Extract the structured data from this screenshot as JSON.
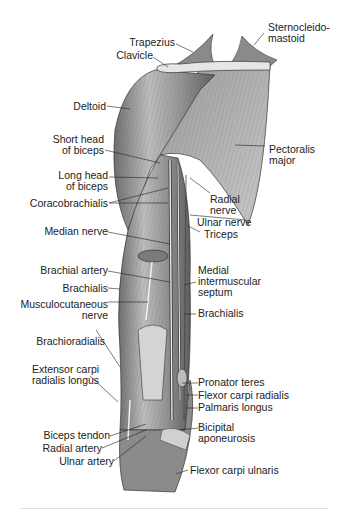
{
  "figure": {
    "colors": {
      "muscle": "#8c8c8c",
      "muscle_light": "#c9c9c9",
      "muscle_dark": "#4a4a4a",
      "bone": "#e4e4e4",
      "line": "#222222"
    },
    "labels_left": [
      {
        "id": "trapezius",
        "text": "Trapezius"
      },
      {
        "id": "clavicle",
        "text": "Clavicle"
      },
      {
        "id": "deltoid",
        "text": "Deltoid"
      },
      {
        "id": "short-head-biceps",
        "text": "Short head\nof biceps"
      },
      {
        "id": "long-head-biceps",
        "text": "Long head\nof biceps"
      },
      {
        "id": "coracobrachialis",
        "text": "Coracobrachialis"
      },
      {
        "id": "median-nerve",
        "text": "Median nerve"
      },
      {
        "id": "brachial-artery",
        "text": "Brachial artery"
      },
      {
        "id": "brachialis-left",
        "text": "Brachialis"
      },
      {
        "id": "musculocutaneous-nerve",
        "text": "Musculocutaneous\nnerve"
      },
      {
        "id": "brachioradialis",
        "text": "Brachioradialis"
      },
      {
        "id": "extensor-carpi-radialis-longus",
        "text": "Extensor carpi\nradialis longus"
      },
      {
        "id": "biceps-tendon",
        "text": "Biceps tendon"
      },
      {
        "id": "radial-artery",
        "text": "Radial artery"
      },
      {
        "id": "ulnar-artery",
        "text": "Ulnar artery"
      }
    ],
    "labels_right": [
      {
        "id": "sternocleidomastoid",
        "text": "Sternocleido-\nmastoid"
      },
      {
        "id": "pectoralis-major",
        "text": "Pectoralis\nmajor"
      },
      {
        "id": "radial-nerve",
        "text": "Radial\nnerve"
      },
      {
        "id": "ulnar-nerve",
        "text": "Ulnar nerve"
      },
      {
        "id": "triceps",
        "text": "Triceps"
      },
      {
        "id": "medial-intermuscular-septum",
        "text": "Medial\nintermuscular\nseptum"
      },
      {
        "id": "brachialis-right",
        "text": "Brachialis"
      },
      {
        "id": "pronator-teres",
        "text": "Pronator teres"
      },
      {
        "id": "flexor-carpi-radialis",
        "text": "Flexor carpi radialis"
      },
      {
        "id": "palmaris-longus",
        "text": "Palmaris longus"
      },
      {
        "id": "bicipital-aponeurosis",
        "text": "Bicipital\naponeurosis"
      },
      {
        "id": "flexor-carpi-ulnaris",
        "text": "Flexor carpi ulnaris"
      }
    ]
  }
}
